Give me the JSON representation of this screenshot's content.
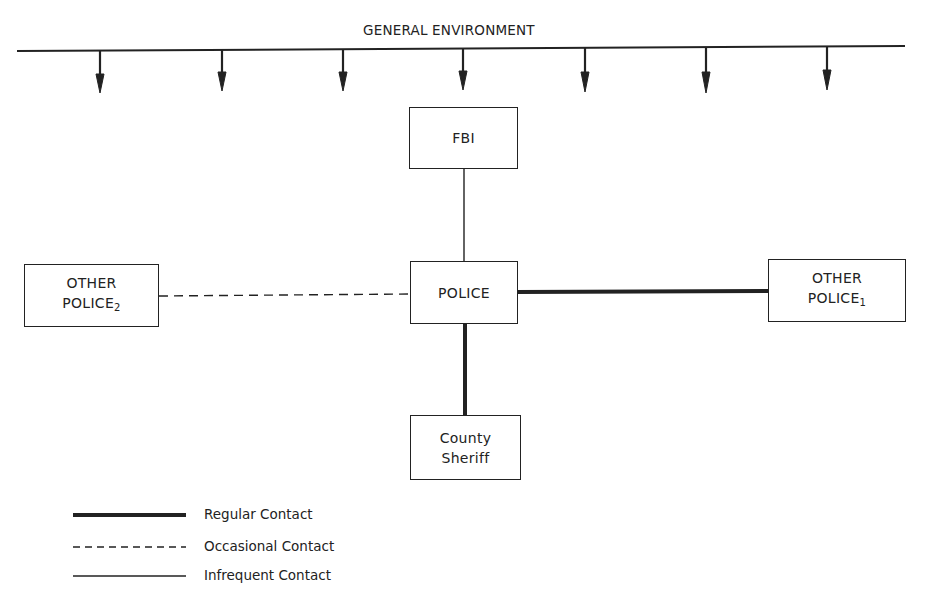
{
  "diagram": {
    "title": "GENERAL ENVIRONMENT",
    "environment_arrows": 7,
    "nodes": {
      "fbi": {
        "label": "FBI"
      },
      "police": {
        "label": "POLICE"
      },
      "other_police_2": {
        "line1": "OTHER",
        "line2": "POLICE",
        "subscript": "2"
      },
      "other_police_1": {
        "line1": "OTHER",
        "line2": "POLICE",
        "subscript": "1"
      },
      "county_sheriff": {
        "line1": "County",
        "line2": "Sheriff"
      }
    },
    "edges": [
      {
        "from": "POLICE",
        "to": "FBI",
        "type": "Infrequent Contact"
      },
      {
        "from": "POLICE",
        "to": "OTHER POLICE2",
        "type": "Occasional Contact"
      },
      {
        "from": "POLICE",
        "to": "OTHER POLICE1",
        "type": "Regular Contact"
      },
      {
        "from": "POLICE",
        "to": "County Sheriff",
        "type": "Regular Contact"
      }
    ]
  },
  "legend": {
    "regular": "Regular Contact",
    "occasional": "Occasional Contact",
    "infrequent": "Infrequent Contact"
  }
}
